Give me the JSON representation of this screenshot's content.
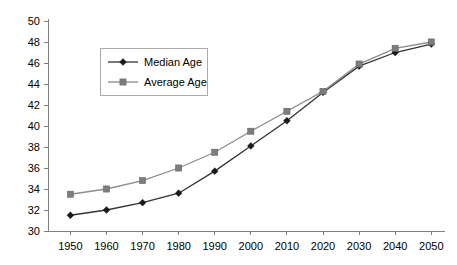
{
  "chart_data": {
    "type": "line",
    "title": "",
    "subtitle": "",
    "xlabel": "",
    "ylabel": "",
    "x": [
      1950,
      1960,
      1970,
      1980,
      1990,
      2000,
      2010,
      2020,
      2030,
      2040,
      2050
    ],
    "categories": [
      "1950",
      "1960",
      "1970",
      "1980",
      "1990",
      "2000",
      "2010",
      "2020",
      "2030",
      "2040",
      "2050"
    ],
    "series": [
      {
        "name": "Median Age",
        "color": "#1a1a1a",
        "marker": "diamond",
        "values": [
          31.5,
          32.0,
          32.7,
          33.6,
          35.7,
          38.1,
          40.5,
          43.2,
          45.7,
          47.0,
          47.8
        ]
      },
      {
        "name": "Average Age",
        "color": "#7d7d7d",
        "marker": "square",
        "values": [
          33.5,
          34.0,
          34.8,
          36.0,
          37.5,
          39.5,
          41.4,
          43.3,
          45.9,
          47.4,
          48.0
        ]
      }
    ],
    "ylim": [
      30,
      50
    ],
    "ytick_step": 2,
    "yticks": [
      30,
      32,
      34,
      36,
      38,
      40,
      42,
      44,
      46,
      48,
      50
    ],
    "ytick_labels": [
      "30",
      "32",
      "34",
      "36",
      "38",
      "40",
      "42",
      "44",
      "46",
      "48",
      "50"
    ],
    "xtick_labels": [
      "1950",
      "1960",
      "1970",
      "1980",
      "1990",
      "2000",
      "2010",
      "2020",
      "2030",
      "2040",
      "2050"
    ],
    "grid": false,
    "legend_position": "upper-left-inset",
    "legend_entries": [
      "Median Age",
      "Average Age"
    ]
  },
  "legend": {
    "items": [
      {
        "label": "Median Age"
      },
      {
        "label": "Average Age"
      }
    ]
  }
}
